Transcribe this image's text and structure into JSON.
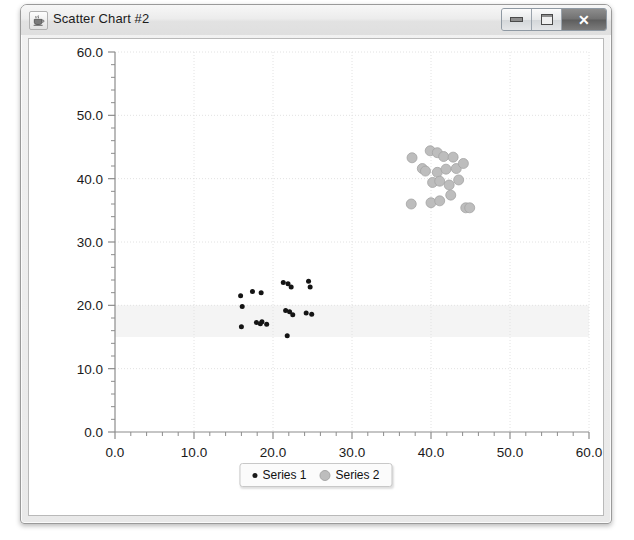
{
  "window": {
    "title": "Scatter Chart #2",
    "icon": "java-coffee-cup-icon",
    "buttons": {
      "minimize_label": "–",
      "maximize_label": "□",
      "close_label": "✕"
    }
  },
  "colors": {
    "series1": "#141414",
    "series2": "#bdbdbd",
    "series2_stroke": "#a3a3a3",
    "axis": "#8c8c8c",
    "gridline": "#e2e2e2",
    "plot_background": "#ffffff",
    "band": "#f4f4f4",
    "tick_label": "#1a1a1a"
  },
  "chart_data": {
    "type": "scatter",
    "title": "",
    "xlabel": "",
    "ylabel": "",
    "xlim": [
      0,
      60
    ],
    "ylim": [
      0,
      60
    ],
    "xticks": [
      "0.0",
      "10.0",
      "20.0",
      "30.0",
      "40.0",
      "50.0",
      "60.0"
    ],
    "yticks": [
      "0.0",
      "10.0",
      "20.0",
      "30.0",
      "40.0",
      "50.0",
      "60.0"
    ],
    "xtick_values": [
      0,
      10,
      20,
      30,
      40,
      50,
      60
    ],
    "ytick_values": [
      0,
      10,
      20,
      30,
      40,
      50,
      60
    ],
    "tick_step": 10,
    "minor_ticks_per_interval": 5,
    "grid": true,
    "grid_style": "dotted",
    "legend": "bottom-center",
    "marker_band": {
      "y_from": 15,
      "y_to": 20
    },
    "series": [
      {
        "name": "Series 1",
        "color": "#141414",
        "marker": "circle",
        "marker_size": 5,
        "points": [
          [
            15.9,
            21.5
          ],
          [
            17.4,
            22.2
          ],
          [
            18.5,
            22.0
          ],
          [
            16.1,
            19.8
          ],
          [
            21.3,
            23.6
          ],
          [
            21.9,
            23.4
          ],
          [
            22.3,
            22.9
          ],
          [
            24.5,
            23.8
          ],
          [
            24.7,
            22.9
          ],
          [
            16.0,
            16.6
          ],
          [
            17.9,
            17.3
          ],
          [
            18.6,
            17.4
          ],
          [
            19.2,
            17.0
          ],
          [
            21.6,
            19.2
          ],
          [
            22.5,
            18.5
          ],
          [
            24.2,
            18.8
          ],
          [
            24.9,
            18.6
          ],
          [
            21.8,
            15.2
          ],
          [
            18.4,
            17.1
          ],
          [
            22.1,
            19.0
          ]
        ]
      },
      {
        "name": "Series 2",
        "color": "#bdbdbd",
        "marker": "circle",
        "marker_size": 10,
        "points": [
          [
            37.6,
            43.3
          ],
          [
            39.9,
            44.4
          ],
          [
            40.8,
            44.1
          ],
          [
            41.6,
            43.5
          ],
          [
            42.8,
            43.4
          ],
          [
            38.9,
            41.6
          ],
          [
            39.3,
            41.2
          ],
          [
            40.8,
            41.0
          ],
          [
            41.9,
            41.5
          ],
          [
            43.2,
            41.6
          ],
          [
            44.1,
            42.4
          ],
          [
            40.2,
            39.4
          ],
          [
            41.1,
            39.6
          ],
          [
            42.3,
            39.0
          ],
          [
            43.5,
            39.8
          ],
          [
            37.5,
            36.0
          ],
          [
            40.0,
            36.2
          ],
          [
            41.1,
            36.5
          ],
          [
            44.4,
            35.4
          ],
          [
            44.9,
            35.4
          ],
          [
            42.5,
            37.4
          ]
        ]
      }
    ]
  }
}
